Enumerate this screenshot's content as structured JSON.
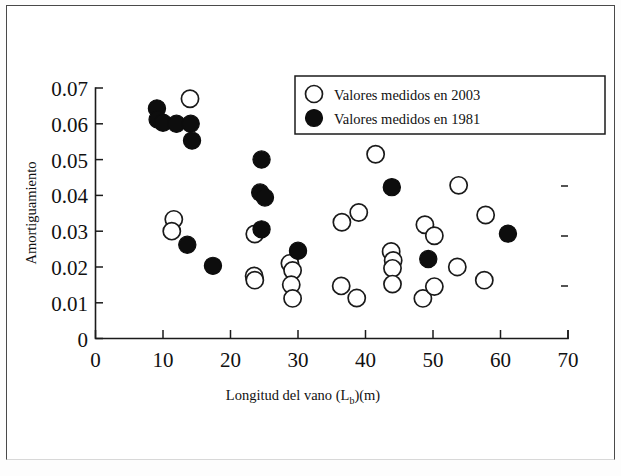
{
  "figure": {
    "background_color": "#ffffff",
    "frame_color": "#4a4a4a"
  },
  "chart_data": {
    "type": "scatter",
    "title": "",
    "xlabel": "Longitud del vano (Lb)(m)",
    "xlabel_main": "Longitud del vano (L",
    "xlabel_sub": "b",
    "xlabel_tail": ")(m)",
    "ylabel": "Amortiguamiento",
    "xlim": [
      0,
      70
    ],
    "ylim": [
      0,
      0.07
    ],
    "grid": false,
    "xticks": [
      0,
      10,
      20,
      30,
      40,
      50,
      60,
      70
    ],
    "xtick_labels": [
      "0",
      "10",
      "20",
      "30",
      "40",
      "50",
      "60",
      "70"
    ],
    "yticks": [
      0,
      0.01,
      0.02,
      0.03,
      0.04,
      0.05,
      0.06,
      0.07
    ],
    "ytick_labels": [
      "0",
      "0.01",
      "0.02",
      "0.03",
      "0.04",
      "0.05",
      "0.06",
      "0.07"
    ],
    "legend_position": "top-right",
    "marker_colors": {
      "open": "#ffffff",
      "open_edge": "#1a1a1a",
      "filled": "#0d0d0d"
    },
    "series": [
      {
        "name": "Valores medidos en 2003",
        "marker": "open-circle",
        "color": "#ffffff",
        "edge_color": "#1a1a1a",
        "points": [
          [
            14.0,
            0.067
          ],
          [
            11.6,
            0.0333
          ],
          [
            11.3,
            0.03
          ],
          [
            23.6,
            0.0292
          ],
          [
            23.5,
            0.0175
          ],
          [
            23.6,
            0.0163
          ],
          [
            28.8,
            0.021
          ],
          [
            29.2,
            0.019
          ],
          [
            29.0,
            0.015
          ],
          [
            29.2,
            0.0112
          ],
          [
            36.5,
            0.0325
          ],
          [
            39.0,
            0.0352
          ],
          [
            36.4,
            0.0147
          ],
          [
            38.7,
            0.0113
          ],
          [
            41.5,
            0.0515
          ],
          [
            43.8,
            0.0243
          ],
          [
            44.1,
            0.0218
          ],
          [
            44.0,
            0.0196
          ],
          [
            44.0,
            0.0152
          ],
          [
            48.8,
            0.0318
          ],
          [
            50.2,
            0.0287
          ],
          [
            48.5,
            0.0112
          ],
          [
            50.2,
            0.0145
          ],
          [
            53.8,
            0.0428
          ],
          [
            53.6,
            0.02
          ],
          [
            57.8,
            0.0345
          ],
          [
            57.6,
            0.0163
          ]
        ]
      },
      {
        "name": "Valores medidos en 1981",
        "marker": "filled-circle",
        "color": "#0d0d0d",
        "points": [
          [
            9.1,
            0.0643
          ],
          [
            9.2,
            0.0612
          ],
          [
            10.0,
            0.0603
          ],
          [
            12.0,
            0.06
          ],
          [
            14.1,
            0.06
          ],
          [
            14.3,
            0.0553
          ],
          [
            13.6,
            0.0262
          ],
          [
            17.4,
            0.0203
          ],
          [
            24.6,
            0.05
          ],
          [
            24.4,
            0.0408
          ],
          [
            25.1,
            0.0394
          ],
          [
            24.6,
            0.0305
          ],
          [
            30.0,
            0.0245
          ],
          [
            43.9,
            0.0423
          ],
          [
            49.3,
            0.0222
          ],
          [
            61.1,
            0.0293
          ]
        ]
      }
    ]
  },
  "legend": {
    "entries": [
      {
        "label": "Valores medidos en 2003",
        "marker": "open-circle"
      },
      {
        "label": "Valores medidos en 1981",
        "marker": "filled-circle"
      }
    ]
  }
}
